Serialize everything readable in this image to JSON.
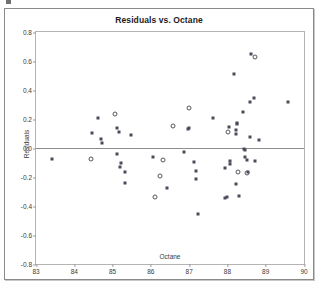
{
  "figure": {
    "title": "Residuals vs. Octane",
    "xlabel": "Octane",
    "ylabel": "Residuals"
  },
  "axes": {
    "y_ticks": [
      "0.8",
      "0.6",
      "0.4",
      "0.2",
      "0.0",
      "-0.2",
      "-0.4",
      "-0.6",
      "-0.8"
    ],
    "x_ticks": [
      "83",
      "84",
      "85",
      "86",
      "87",
      "88",
      "89",
      "90"
    ]
  },
  "colors": {
    "marker_filled": "#4b4b5a",
    "marker_open": "#55555f",
    "zero_line": "#8c8c8c",
    "panel_border": "#b4b4b4",
    "frame_border": "#8a8a8a",
    "background": "#ffffff",
    "text": "#3a3a3a",
    "title_text": "#1b1b1b"
  },
  "chart_data": {
    "type": "scatter",
    "title": "Residuals vs. Octane",
    "xlabel": "Octane",
    "ylabel": "Residuals",
    "xlim": [
      83,
      90
    ],
    "ylim": [
      -0.8,
      0.8
    ],
    "xticks": [
      83,
      84,
      85,
      86,
      87,
      88,
      89,
      90
    ],
    "yticks": [
      0.8,
      0.6,
      0.4,
      0.2,
      0.0,
      -0.2,
      -0.4,
      -0.6,
      -0.8
    ],
    "grid": false,
    "legend": "none",
    "annotations": [
      {
        "type": "hline",
        "y": 0.0,
        "label": "zero reference line"
      }
    ],
    "series": [
      {
        "name": "Residual (filled marker)",
        "marker": "filled-square",
        "points": [
          [
            83.42,
            -0.075
          ],
          [
            84.46,
            0.103
          ],
          [
            84.63,
            0.207
          ],
          [
            84.71,
            0.063
          ],
          [
            84.72,
            0.032
          ],
          [
            85.12,
            0.137
          ],
          [
            85.17,
            0.113
          ],
          [
            85.12,
            -0.04
          ],
          [
            85.22,
            -0.103
          ],
          [
            85.2,
            -0.133
          ],
          [
            85.33,
            -0.168
          ],
          [
            85.32,
            -0.243
          ],
          [
            85.48,
            0.09
          ],
          [
            86.05,
            -0.065
          ],
          [
            86.43,
            -0.278
          ],
          [
            86.87,
            -0.03
          ],
          [
            86.97,
            0.13
          ],
          [
            87.0,
            0.14
          ],
          [
            87.12,
            -0.098
          ],
          [
            87.17,
            -0.16
          ],
          [
            87.18,
            -0.215
          ],
          [
            87.22,
            -0.458
          ],
          [
            87.63,
            0.207
          ],
          [
            87.93,
            -0.135
          ],
          [
            87.93,
            -0.345
          ],
          [
            87.99,
            -0.34
          ],
          [
            88.03,
            0.148
          ],
          [
            88.06,
            -0.09
          ],
          [
            88.06,
            -0.108
          ],
          [
            88.18,
            0.512
          ],
          [
            88.22,
            0.122
          ],
          [
            88.23,
            0.1
          ],
          [
            88.25,
            0.165
          ],
          [
            88.26,
            0.172
          ],
          [
            88.22,
            -0.248
          ],
          [
            88.3,
            -0.33
          ],
          [
            88.4,
            0.25
          ],
          [
            88.44,
            -0.005
          ],
          [
            88.45,
            -0.012
          ],
          [
            88.47,
            -0.063
          ],
          [
            88.5,
            -0.085
          ],
          [
            88.55,
            -0.165
          ],
          [
            88.58,
            0.315
          ],
          [
            88.6,
            0.078
          ],
          [
            88.62,
            0.65
          ],
          [
            88.7,
            0.348
          ],
          [
            88.72,
            -0.09
          ],
          [
            88.83,
            0.055
          ],
          [
            89.57,
            0.318
          ]
        ]
      },
      {
        "name": "Residual (open marker)",
        "marker": "open-circle",
        "points": [
          [
            84.43,
            -0.078
          ],
          [
            85.06,
            0.237
          ],
          [
            86.25,
            -0.193
          ],
          [
            86.12,
            -0.335
          ],
          [
            86.32,
            -0.08
          ],
          [
            86.58,
            0.155
          ],
          [
            87.0,
            0.278
          ],
          [
            88.02,
            0.108
          ],
          [
            88.28,
            -0.168
          ],
          [
            88.5,
            -0.175
          ],
          [
            88.72,
            0.63
          ]
        ]
      }
    ]
  }
}
